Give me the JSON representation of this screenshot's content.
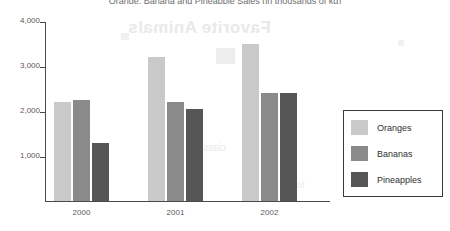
{
  "chart_data": {
    "type": "bar",
    "title": "Orange, Banana and Pineapple Sales (in thousands of kg)",
    "xlabel": "",
    "ylabel": "",
    "categories": [
      "2000",
      "2001",
      "2002"
    ],
    "series": [
      {
        "name": "Oranges",
        "color": "#c9c9c9",
        "values": [
          2200,
          3200,
          3500
        ]
      },
      {
        "name": "Bananas",
        "color": "#8a8a8a",
        "values": [
          2250,
          2200,
          2400
        ]
      },
      {
        "name": "Pineapples",
        "color": "#565656",
        "values": [
          1300,
          2050,
          2400
        ]
      }
    ],
    "ylim": [
      0,
      4000
    ],
    "yticks": [
      1000,
      2000,
      3000,
      4000
    ],
    "ytick_labels": [
      "1,000",
      "2,000",
      "3,000",
      "4,000"
    ],
    "grid": false,
    "legend_position": "right"
  },
  "legend": {
    "entries": [
      {
        "label": "Oranges"
      },
      {
        "label": "Bananas"
      },
      {
        "label": "Pineapples"
      }
    ]
  },
  "artifacts": {
    "bleed_heading": "Favorite Animals",
    "bleed_word_a": "classic",
    "bleed_word_b": "forest"
  }
}
